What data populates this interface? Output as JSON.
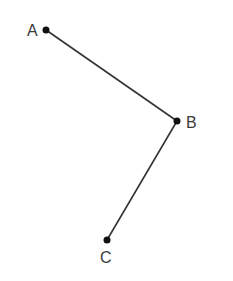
{
  "diagram": {
    "points": [
      {
        "id": "A",
        "label": "A",
        "x": 46,
        "y": 30
      },
      {
        "id": "B",
        "label": "B",
        "x": 177,
        "y": 121
      },
      {
        "id": "C",
        "label": "C",
        "x": 107,
        "y": 240
      }
    ],
    "segments": [
      {
        "from": "A",
        "to": "B"
      },
      {
        "from": "B",
        "to": "C"
      }
    ],
    "colors": {
      "line": "#333333",
      "point": "#111111",
      "label": "#3a3a3a"
    }
  }
}
